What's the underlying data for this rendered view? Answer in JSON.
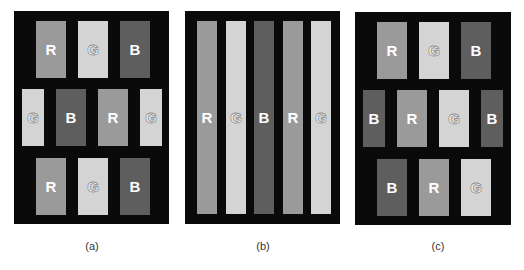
{
  "colors": {
    "background": "#ffffff",
    "frame": "#0a0a0a",
    "R": "#9a9a9a",
    "G": "#d4d4d4",
    "B": "#5e5e5e",
    "letter": "#ffffff"
  },
  "panels": [
    {
      "caption": "(a)",
      "layout": "staggered brick, RGB rows",
      "rows": [
        [
          "R",
          "G",
          "B"
        ],
        [
          "G",
          "B",
          "R",
          "G"
        ],
        [
          "R",
          "G",
          "B"
        ]
      ]
    },
    {
      "caption": "(b)",
      "layout": "vertical stripes",
      "rows": [
        [
          "R",
          "G",
          "B",
          "R",
          "G"
        ]
      ]
    },
    {
      "caption": "(c)",
      "layout": "staggered brick, shifted RGB rows",
      "rows": [
        [
          "R",
          "G",
          "B"
        ],
        [
          "B",
          "R",
          "G",
          "B"
        ],
        [
          "B",
          "R",
          "G"
        ]
      ]
    }
  ],
  "labels": {
    "a": {
      "r0": [
        "R",
        "G",
        "B"
      ],
      "r1": [
        "G",
        "B",
        "R",
        "G"
      ],
      "r2": [
        "R",
        "G",
        "B"
      ],
      "caption": "(a)"
    },
    "b": {
      "r0": [
        "R",
        "G",
        "B",
        "R",
        "G"
      ],
      "caption": "(b)"
    },
    "c": {
      "r0": [
        "R",
        "G",
        "B"
      ],
      "r1": [
        "B",
        "R",
        "G",
        "B"
      ],
      "r2": [
        "B",
        "R",
        "G"
      ],
      "caption": "(c)"
    }
  }
}
